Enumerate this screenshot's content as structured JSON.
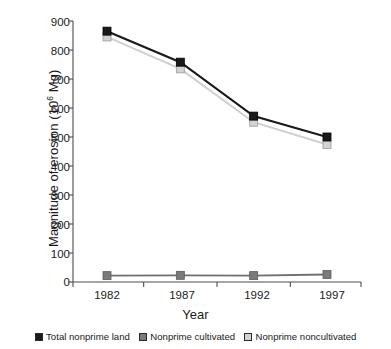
{
  "chart_data": {
    "type": "line",
    "title": "",
    "xlabel": "Year",
    "ylabel": "Magnitude of erosion (10⁶ Mg)",
    "ylabel_base": "Magnitude of erosion (10",
    "ylabel_exp": "6",
    "ylabel_tail": " Mg)",
    "categories": [
      "1982",
      "1987",
      "1992",
      "1997"
    ],
    "x": [
      1982,
      1987,
      1992,
      1997
    ],
    "ylim": [
      0,
      900
    ],
    "xlim": [
      1980.5,
      1998.5
    ],
    "yticks": [
      0,
      100,
      200,
      300,
      400,
      500,
      600,
      700,
      800,
      900
    ],
    "ytick_labels": [
      "0",
      "100",
      "200",
      "300",
      "400",
      "500",
      "600",
      "700",
      "800",
      "900"
    ],
    "xtick_labels": [
      "1982",
      "1987",
      "1992",
      "1997"
    ],
    "grid": false,
    "legend_position": "bottom",
    "series": [
      {
        "name": "Total nonprime land",
        "values": [
          865,
          758,
          572,
          500
        ],
        "color": "#1a1a1a",
        "marker_fill": "#1a1a1a",
        "line_color": "#1a1a1a",
        "marker": "square"
      },
      {
        "name": "Nonprime cultivated",
        "values": [
          22,
          23,
          22,
          26
        ],
        "color": "#7a7a7a",
        "marker_fill": "#7a7a7a",
        "line_color": "#6e6e6e",
        "marker": "square"
      },
      {
        "name": "Nonprime noncultivated",
        "values": [
          845,
          735,
          551,
          474
        ],
        "color": "#d2d2d2",
        "marker_fill": "#d2d2d2",
        "line_color": "#cfcfcf",
        "marker": "square"
      }
    ]
  },
  "legend": {
    "items": [
      {
        "label": "Total nonprime land",
        "color": "#1a1a1a"
      },
      {
        "label": "Nonprime cultivated",
        "color": "#7a7a7a"
      },
      {
        "label": "Nonprime noncultivated",
        "color": "#d2d2d2"
      }
    ]
  },
  "axes": {
    "y_tick_0": "0",
    "y_tick_1": "100",
    "y_tick_2": "200",
    "y_tick_3": "300",
    "y_tick_4": "400",
    "y_tick_5": "500",
    "y_tick_6": "600",
    "y_tick_7": "700",
    "y_tick_8": "800",
    "y_tick_9": "900",
    "x_tick_0": "1982",
    "x_tick_1": "1987",
    "x_tick_2": "1992",
    "x_tick_3": "1997",
    "x_title": "Year"
  }
}
